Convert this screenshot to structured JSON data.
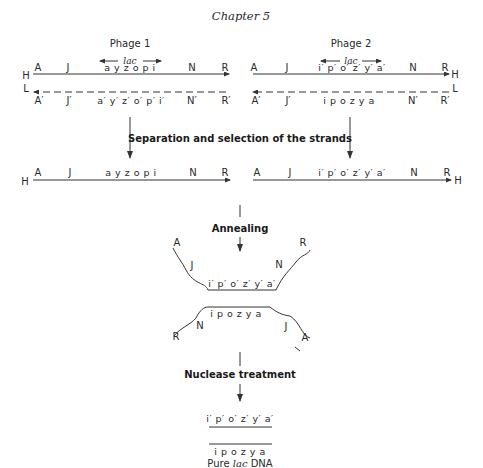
{
  "header": {
    "title": "Chapter 5"
  },
  "phage1": {
    "name": "Phage 1",
    "lac_label": "lac",
    "h_strand": {
      "end_label": "H",
      "genes": [
        "A",
        "J",
        "a y z o p i",
        "N",
        "R"
      ]
    },
    "l_strand": {
      "end_label": "L",
      "genes": [
        "A′",
        "J′",
        "a′ y′ z′ o′ p′ i′",
        "N′",
        "R′"
      ]
    }
  },
  "phage2": {
    "name": "Phage 2",
    "lac_label": "lac",
    "h_strand": {
      "end_label": "H",
      "genes": [
        "A",
        "J",
        "i′ p′ o′ z′ y′ a′",
        "N",
        "R"
      ]
    },
    "l_strand": {
      "end_label": "L",
      "genes": [
        "A′",
        "J′",
        "i p o z y a",
        "N′",
        "R′"
      ]
    }
  },
  "steps": {
    "separation": "Separation and selection of the strands",
    "annealing": "Annealing",
    "nuclease": "Nuclease treatment"
  },
  "selected": {
    "left": {
      "end_label": "H",
      "genes": [
        "A",
        "J",
        "a y z o p i",
        "N",
        "R"
      ]
    },
    "right": {
      "end_label": "H",
      "genes": [
        "A",
        "J",
        "i′ p′ o′ z′ y′ a′",
        "N",
        "R"
      ]
    }
  },
  "annealed": {
    "top": {
      "left_end": "A",
      "left_gene": "J",
      "middle": "i′ p′ o′ z′ y′ a′",
      "right_gene": "N",
      "right_end": "R"
    },
    "bottom": {
      "left_end": "R",
      "left_gene": "N",
      "middle": "i p o z y a",
      "right_gene": "J",
      "right_end": "A"
    }
  },
  "result": {
    "top_strand": "i′ p′ o′ z′ y′ a′",
    "bottom_strand": "i p o z y a",
    "caption_prefix": "Pure ",
    "caption_italic": "lac",
    "caption_suffix": " DNA"
  }
}
